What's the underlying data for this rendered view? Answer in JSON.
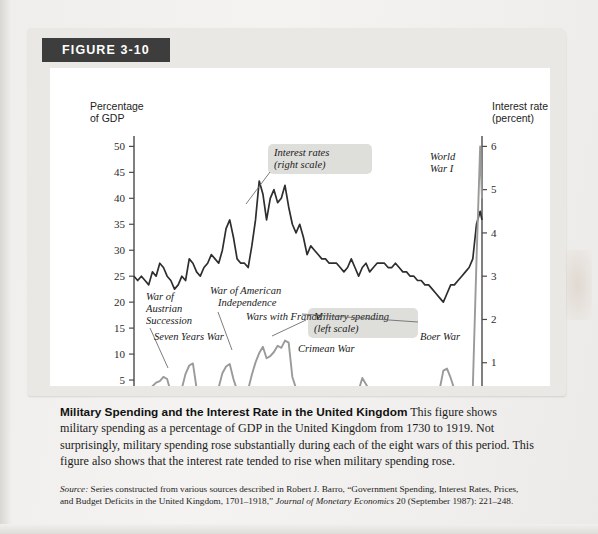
{
  "figure": {
    "badge_label": "FIGURE 3-10"
  },
  "axes": {
    "left_title_line1": "Percentage",
    "left_title_line2": "of GDP",
    "right_title_line1": "Interest rate",
    "right_title_line2": "(percent)",
    "x_title": "Year",
    "left_ticks": [
      "0",
      "5",
      "10",
      "15",
      "20",
      "25",
      "30",
      "35",
      "40",
      "45",
      "50"
    ],
    "right_ticks": [
      "0",
      "1",
      "2",
      "3",
      "4",
      "5",
      "6"
    ],
    "x_ticks": [
      "1730",
      "1750",
      "1770",
      "1790",
      "1810",
      "1830",
      "1850",
      "1870",
      "1890",
      "1910"
    ]
  },
  "annotations": {
    "interest_label_line1": "Interest rates",
    "interest_label_line2": "(right scale)",
    "military_label_line1": "Military spending",
    "military_label_line2": "(left scale)",
    "war_austrian_l1": "War of",
    "war_austrian_l2": "Austrian",
    "war_austrian_l3": "Succession",
    "seven_years": "Seven Years War",
    "war_american_l1": "War of American",
    "war_american_l2": "Independence",
    "wars_france": "Wars with France",
    "crimean": "Crimean War",
    "boer": "Boer War",
    "wwi_l1": "World",
    "wwi_l2": "War I"
  },
  "caption": {
    "title": "Military Spending and the Interest Rate in the United Kingdom",
    "body": " This figure shows military spending as a percentage of GDP in the United Kingdom from 1730 to 1919. Not surprisingly, military spending rose substantially during each of the eight wars of this period. This figure also shows that the interest rate tended to rise when military spending rose."
  },
  "source": {
    "label": "Source:",
    "text_before_journal": " Series constructed from various sources described in Robert J. Barro, “Government Spending, Interest Rates, Prices, and Budget Deficits in the United Kingdom, 1701–1918,” ",
    "journal": "Journal of Monetary Economics",
    "text_after_journal": " 20 (September 1987): 221–248."
  },
  "colors": {
    "interest_line": "#2e2e2e",
    "military_line": "#9a9a98",
    "card_bg": "#e9e8e5",
    "badge_bg": "#3e3d3d",
    "plot_bg": "#ffffff",
    "highlight_box": "#dededb"
  },
  "chart_data": {
    "type": "line",
    "title": "Military Spending and the Interest Rate in the United Kingdom",
    "xlabel": "Year",
    "ylabel": "Percentage of GDP",
    "ylabel_right": "Interest rate (percent)",
    "xlim": [
      1730,
      1919
    ],
    "ylim": [
      0,
      52
    ],
    "ylim_right": [
      0,
      6.24
    ],
    "grid": false,
    "legend": "in-plot annotations",
    "series": [
      {
        "name": "Interest rates (right scale)",
        "axis": "right",
        "units": "percent",
        "color": "#2e2e2e",
        "x": [
          1730,
          1732,
          1734,
          1736,
          1738,
          1740,
          1742,
          1744,
          1746,
          1748,
          1750,
          1752,
          1754,
          1756,
          1758,
          1760,
          1762,
          1764,
          1766,
          1768,
          1770,
          1772,
          1774,
          1776,
          1778,
          1780,
          1782,
          1784,
          1786,
          1788,
          1790,
          1792,
          1794,
          1796,
          1798,
          1800,
          1802,
          1804,
          1806,
          1808,
          1810,
          1812,
          1814,
          1816,
          1818,
          1820,
          1822,
          1824,
          1826,
          1828,
          1830,
          1832,
          1834,
          1836,
          1838,
          1840,
          1842,
          1844,
          1846,
          1848,
          1850,
          1852,
          1854,
          1856,
          1858,
          1860,
          1862,
          1864,
          1866,
          1868,
          1870,
          1872,
          1874,
          1876,
          1878,
          1880,
          1882,
          1884,
          1886,
          1888,
          1890,
          1892,
          1894,
          1896,
          1898,
          1900,
          1902,
          1904,
          1906,
          1908,
          1910,
          1912,
          1914,
          1916,
          1918,
          1919
        ],
        "y": [
          3.0,
          2.9,
          3.0,
          2.9,
          2.8,
          3.1,
          3.0,
          3.3,
          3.2,
          3.0,
          2.9,
          2.7,
          2.8,
          3.0,
          2.9,
          3.4,
          3.3,
          3.1,
          3.0,
          3.2,
          3.3,
          3.5,
          3.4,
          3.3,
          3.6,
          4.1,
          4.3,
          3.9,
          3.4,
          3.3,
          3.3,
          3.2,
          3.7,
          4.3,
          5.2,
          4.9,
          4.3,
          4.8,
          5.0,
          4.7,
          4.8,
          5.1,
          4.6,
          4.2,
          4.0,
          4.2,
          3.9,
          3.5,
          3.7,
          3.6,
          3.5,
          3.4,
          3.4,
          3.3,
          3.3,
          3.3,
          3.2,
          3.1,
          3.2,
          3.4,
          3.2,
          3.0,
          3.2,
          3.3,
          3.1,
          3.2,
          3.3,
          3.3,
          3.3,
          3.2,
          3.2,
          3.3,
          3.2,
          3.1,
          3.1,
          3.0,
          3.0,
          2.9,
          2.9,
          2.8,
          2.8,
          2.7,
          2.6,
          2.5,
          2.4,
          2.6,
          2.8,
          2.8,
          2.9,
          3.0,
          3.1,
          3.2,
          3.4,
          4.2,
          4.5,
          4.3
        ]
      },
      {
        "name": "Military spending (left scale)",
        "axis": "left",
        "units": "percent of GDP",
        "color": "#9a9a98",
        "x": [
          1730,
          1732,
          1734,
          1736,
          1738,
          1740,
          1742,
          1744,
          1746,
          1748,
          1750,
          1752,
          1754,
          1756,
          1758,
          1760,
          1762,
          1764,
          1766,
          1768,
          1770,
          1772,
          1774,
          1776,
          1778,
          1780,
          1782,
          1784,
          1786,
          1788,
          1790,
          1792,
          1794,
          1796,
          1798,
          1800,
          1802,
          1804,
          1806,
          1808,
          1810,
          1812,
          1814,
          1816,
          1818,
          1820,
          1822,
          1824,
          1826,
          1828,
          1830,
          1832,
          1834,
          1836,
          1838,
          1840,
          1842,
          1844,
          1846,
          1848,
          1850,
          1852,
          1854,
          1856,
          1858,
          1860,
          1862,
          1864,
          1866,
          1868,
          1870,
          1872,
          1874,
          1876,
          1878,
          1880,
          1882,
          1884,
          1886,
          1888,
          1890,
          1892,
          1894,
          1896,
          1898,
          1900,
          1902,
          1904,
          1906,
          1908,
          1910,
          1912,
          1914,
          1916,
          1918,
          1919
        ],
        "y": [
          2.3,
          2.2,
          2.1,
          2.2,
          2.6,
          3.8,
          4.5,
          4.8,
          5.6,
          5.2,
          2.6,
          2.2,
          2.1,
          3.4,
          6.2,
          7.8,
          8.2,
          3.4,
          2.6,
          2.3,
          2.2,
          2.3,
          2.3,
          3.6,
          6.3,
          7.6,
          8.1,
          5.2,
          3.0,
          2.8,
          2.9,
          3.2,
          6.0,
          8.4,
          10.2,
          11.4,
          9.2,
          9.6,
          10.4,
          11.6,
          11.2,
          12.6,
          12.2,
          5.6,
          3.4,
          2.9,
          2.7,
          2.6,
          2.6,
          2.6,
          2.5,
          2.4,
          2.4,
          2.4,
          2.4,
          2.5,
          2.6,
          2.6,
          2.7,
          2.8,
          2.8,
          3.0,
          5.4,
          4.2,
          2.9,
          3.2,
          3.0,
          2.9,
          2.8,
          2.7,
          2.8,
          2.7,
          2.6,
          2.7,
          3.1,
          2.8,
          2.8,
          2.7,
          2.8,
          2.9,
          3.0,
          3.0,
          3.0,
          3.2,
          6.8,
          7.2,
          5.4,
          3.2,
          3.0,
          3.0,
          3.0,
          3.1,
          3.4,
          28.0,
          50.0,
          40.0
        ]
      }
    ],
    "annotations": [
      {
        "text": "War of Austrian Succession",
        "x": 1742,
        "y": 5.2
      },
      {
        "text": "Seven Years War",
        "x": 1759,
        "y": 8.2
      },
      {
        "text": "War of American Independence",
        "x": 1780,
        "y": 8.1
      },
      {
        "text": "Wars with France",
        "x": 1800,
        "y": 12.6
      },
      {
        "text": "Crimean War",
        "x": 1854,
        "y": 5.4
      },
      {
        "text": "Boer War",
        "x": 1900,
        "y": 7.2
      },
      {
        "text": "World War I",
        "x": 1917,
        "y": 50.0
      }
    ]
  }
}
